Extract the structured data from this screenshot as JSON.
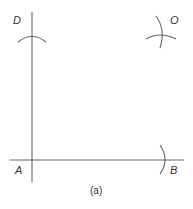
{
  "diagram": {
    "caption": "(a)",
    "points": {
      "A": {
        "label": "A"
      },
      "B": {
        "label": "B"
      },
      "D": {
        "label": "D"
      },
      "O": {
        "label": "O"
      }
    },
    "colors": {
      "line": "#666666",
      "text": "#333333",
      "background": "#ffffff"
    }
  }
}
